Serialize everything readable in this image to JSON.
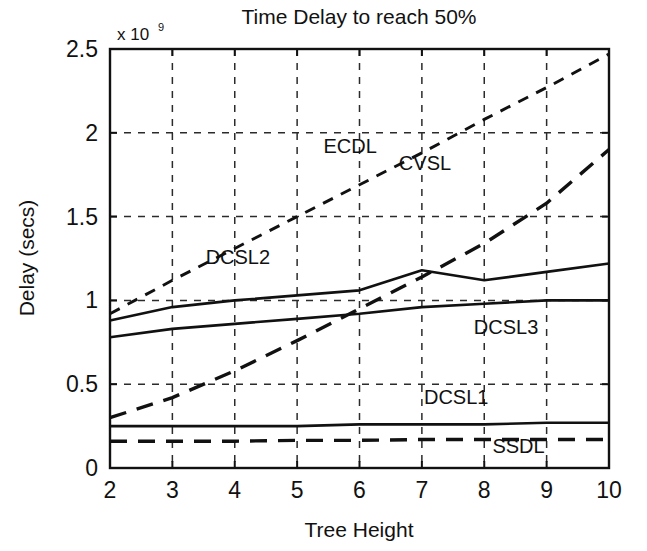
{
  "chart_data": {
    "type": "line",
    "title": "Time Delay to reach 50%",
    "xlabel": "Tree  Height",
    "ylabel": "Delay (secs)",
    "y_multiplier": "x 10",
    "y_multiplier_exponent": "9",
    "xlim": [
      2,
      10
    ],
    "ylim": [
      0,
      2.5
    ],
    "xticks": [
      2,
      3,
      4,
      5,
      6,
      7,
      8,
      9,
      10
    ],
    "xtick_labels": [
      "2",
      "3",
      "4",
      "5",
      "6",
      "7",
      "8",
      "9",
      "10"
    ],
    "yticks": [
      0,
      0.5,
      1,
      1.5,
      2,
      2.5
    ],
    "ytick_labels": [
      "0",
      "0.5",
      "1",
      "1.5",
      "2",
      "2.5"
    ],
    "grid": true,
    "grid_style": "dashed",
    "legend_position": "inline-labels",
    "x": [
      2,
      3,
      4,
      5,
      6,
      7,
      8,
      9,
      10
    ],
    "series": [
      {
        "name": "ECDL",
        "style": "dashed-short",
        "label_x": 5.85,
        "label_y": 1.88,
        "values": [
          0.92,
          1.12,
          1.31,
          1.5,
          1.69,
          1.88,
          2.08,
          2.27,
          2.47
        ]
      },
      {
        "name": "CVSL",
        "style": "dashed-long",
        "label_x": 7.05,
        "label_y": 1.78,
        "values": [
          0.3,
          0.42,
          0.58,
          0.76,
          0.95,
          1.14,
          1.34,
          1.58,
          1.9
        ]
      },
      {
        "name": "DCSL2",
        "style": "solid",
        "label_x": 4.05,
        "label_y": 1.22,
        "values": [
          0.88,
          0.96,
          1.0,
          1.03,
          1.06,
          1.18,
          1.12,
          1.17,
          1.22
        ]
      },
      {
        "name": "DCSL3",
        "style": "solid",
        "label_x": 8.35,
        "label_y": 0.8,
        "values": [
          0.78,
          0.83,
          0.86,
          0.89,
          0.92,
          0.96,
          0.98,
          1.0,
          1.0
        ]
      },
      {
        "name": "DCSL1",
        "style": "solid",
        "label_x": 7.55,
        "label_y": 0.38,
        "values": [
          0.25,
          0.25,
          0.25,
          0.25,
          0.26,
          0.26,
          0.26,
          0.27,
          0.27
        ]
      },
      {
        "name": "SSDL",
        "style": "dashed-long",
        "label_x": 8.55,
        "label_y": 0.09,
        "values": [
          0.16,
          0.16,
          0.16,
          0.165,
          0.165,
          0.17,
          0.17,
          0.17,
          0.17
        ]
      }
    ]
  }
}
